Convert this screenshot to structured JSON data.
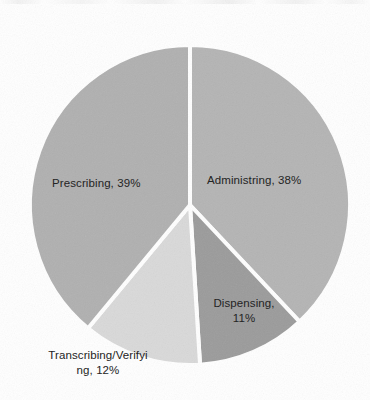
{
  "chart_data": {
    "type": "pie",
    "title": "",
    "subtitle": "",
    "xlabel": "",
    "ylabel": "",
    "legend_position": "none",
    "labels_position": "inside-and-outside",
    "grid": false,
    "start_angle_deg": 0,
    "direction": "clockwise",
    "categories": [
      "Administring",
      "Dispensing",
      "Transcribing/Verifying",
      "Prescribing"
    ],
    "values": [
      38,
      11,
      12,
      39
    ],
    "value_unit": "%",
    "slices": [
      {
        "name": "Administring",
        "value": 38,
        "value_text": "38%",
        "label_text": "Administring, 38%",
        "label_lines": [
          "Administring, 38%"
        ],
        "color": "#b4b4b4",
        "start_angle_deg": 0,
        "end_angle_deg": 136.8,
        "label_placement": "inside"
      },
      {
        "name": "Dispensing",
        "value": 11,
        "value_text": "11%",
        "label_text": "Dispensing, 11%",
        "label_lines": [
          "Dispensing,",
          "11%"
        ],
        "color": "#9b9b9b",
        "start_angle_deg": 136.8,
        "end_angle_deg": 176.4,
        "label_placement": "inside"
      },
      {
        "name": "Transcribing/Verifying",
        "value": 12,
        "value_text": "12%",
        "label_text": "Transcribing/Verifying, 12%",
        "label_lines": [
          "Transcribing/Verifyi",
          "ng, 12%"
        ],
        "color": "#d9d9d9",
        "start_angle_deg": 176.4,
        "end_angle_deg": 219.6,
        "label_placement": "outside"
      },
      {
        "name": "Prescribing",
        "value": 39,
        "value_text": "39%",
        "label_text": "Prescribing, 39%",
        "label_lines": [
          "Prescribing, 39%"
        ],
        "color": "#b0b0b0",
        "start_angle_deg": 219.6,
        "end_angle_deg": 360,
        "label_placement": "inside"
      }
    ],
    "geometry": {
      "center_x": 190,
      "center_y": 205,
      "radius": 160
    },
    "colors": {
      "background": "#ffffff",
      "slice_border": "#ffffff",
      "label_text": "#242424"
    }
  }
}
